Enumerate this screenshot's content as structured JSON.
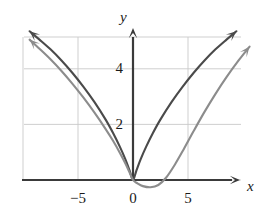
{
  "figure": {
    "name": "cartesian-graph",
    "background": "#ffffff",
    "grid_color": "#c9c9c9",
    "axis_color": "#3a3a3a"
  },
  "axes": {
    "x_label": "x",
    "y_label": "y",
    "x_ticks": [
      {
        "value": -5,
        "label": "-5",
        "px": 78
      },
      {
        "value": 0,
        "label": "0",
        "px": 133
      },
      {
        "value": 5,
        "label": "5",
        "px": 188
      }
    ],
    "y_ticks": [
      {
        "value": 2,
        "label": "2",
        "px": 124
      },
      {
        "value": 4,
        "label": "4",
        "px": 68
      }
    ],
    "x_range": [
      -9.8,
      11.5
    ],
    "y_range": [
      -0.8,
      6.0
    ],
    "grid_spacing_x": 5,
    "grid_spacing_y": 2,
    "x_axis_arrow": true,
    "y_axis_arrow": true
  },
  "chart_data": {
    "type": "line",
    "title": "",
    "xlabel": "x",
    "ylabel": "y",
    "xlim": [
      -9.8,
      11.5
    ],
    "ylim": [
      -0.8,
      6.0
    ],
    "grid": true,
    "legend": "none",
    "series": [
      {
        "name": "curve-dark",
        "color": "#4a4a4a",
        "width": 2.1,
        "arrow_start": true,
        "arrow_end": true,
        "description": "symmetric V-shaped curve with vertex at the origin, concave down on both branches",
        "points": [
          {
            "x": -9.4,
            "y": 5.35
          },
          {
            "x": -8.5,
            "y": 5.05
          },
          {
            "x": -7.5,
            "y": 4.7
          },
          {
            "x": -6.5,
            "y": 4.3
          },
          {
            "x": -5.5,
            "y": 3.85
          },
          {
            "x": -4.5,
            "y": 3.35
          },
          {
            "x": -3.5,
            "y": 2.8
          },
          {
            "x": -2.5,
            "y": 2.18
          },
          {
            "x": -1.8,
            "y": 1.68
          },
          {
            "x": -1.2,
            "y": 1.2
          },
          {
            "x": -0.7,
            "y": 0.75
          },
          {
            "x": -0.3,
            "y": 0.33
          },
          {
            "x": 0,
            "y": 0
          },
          {
            "x": 0.3,
            "y": 0.33
          },
          {
            "x": 0.7,
            "y": 0.75
          },
          {
            "x": 1.2,
            "y": 1.2
          },
          {
            "x": 1.8,
            "y": 1.68
          },
          {
            "x": 2.5,
            "y": 2.18
          },
          {
            "x": 3.5,
            "y": 2.8
          },
          {
            "x": 4.5,
            "y": 3.35
          },
          {
            "x": 5.5,
            "y": 3.85
          },
          {
            "x": 6.5,
            "y": 4.3
          },
          {
            "x": 7.5,
            "y": 4.7
          },
          {
            "x": 8.5,
            "y": 5.05
          },
          {
            "x": 9.4,
            "y": 5.35
          }
        ]
      },
      {
        "name": "curve-gray",
        "color": "#8c8c8c",
        "width": 2.1,
        "arrow_start": true,
        "arrow_end": true,
        "description": "curve through the origin with a flat local minimum near x = 1.6, shifted right of the dark curve",
        "points": [
          {
            "x": -9.4,
            "y": 5.05
          },
          {
            "x": -8.5,
            "y": 4.72
          },
          {
            "x": -7.5,
            "y": 4.34
          },
          {
            "x": -6.5,
            "y": 3.92
          },
          {
            "x": -5.5,
            "y": 3.46
          },
          {
            "x": -4.5,
            "y": 2.96
          },
          {
            "x": -3.5,
            "y": 2.42
          },
          {
            "x": -2.5,
            "y": 1.84
          },
          {
            "x": -1.8,
            "y": 1.4
          },
          {
            "x": -1.2,
            "y": 0.98
          },
          {
            "x": -0.7,
            "y": 0.6
          },
          {
            "x": -0.3,
            "y": 0.26
          },
          {
            "x": 0,
            "y": 0
          },
          {
            "x": 0.4,
            "y": -0.12
          },
          {
            "x": 0.9,
            "y": -0.22
          },
          {
            "x": 1.6,
            "y": -0.26
          },
          {
            "x": 2.3,
            "y": -0.18
          },
          {
            "x": 3.0,
            "y": 0.08
          },
          {
            "x": 3.8,
            "y": 0.55
          },
          {
            "x": 4.6,
            "y": 1.1
          },
          {
            "x": 5.5,
            "y": 1.75
          },
          {
            "x": 6.5,
            "y": 2.45
          },
          {
            "x": 7.5,
            "y": 3.1
          },
          {
            "x": 8.5,
            "y": 3.7
          },
          {
            "x": 9.6,
            "y": 4.3
          },
          {
            "x": 10.6,
            "y": 4.8
          }
        ]
      }
    ]
  }
}
